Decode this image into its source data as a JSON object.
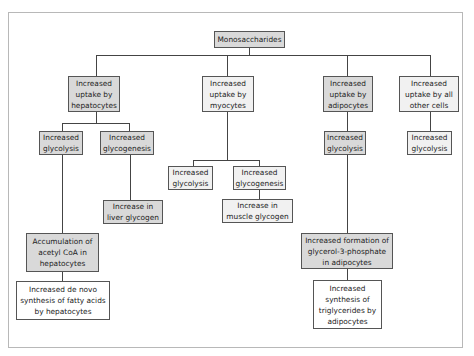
{
  "diagram": {
    "root": {
      "label": "Monosaccharides"
    },
    "branches": [
      {
        "label": "Increased\nuptake by\nhepatocytes",
        "children": [
          {
            "label": "Increased\nglycolysis"
          },
          {
            "label": "Increased\nglycogenesis"
          }
        ]
      },
      {
        "label": "Increased\nuptake by\nmyocytes",
        "children": [
          {
            "label": "Increased\nglycolysis"
          },
          {
            "label": "Increased\nglycogenesis"
          }
        ]
      },
      {
        "label": "Increased\nuptake by\nadipocytes",
        "children": [
          {
            "label": "Increased\nglycolysis"
          }
        ]
      },
      {
        "label": "Increased\nuptake by all\nother cells",
        "children": [
          {
            "label": "Increased\nglycolysis"
          }
        ]
      }
    ],
    "outcomes": {
      "liver_glycogen": "Increase in\nliver glycogen",
      "muscle_glycogen": "Increase in\nmuscle glycogen",
      "acetyl_coa": "Accumulation of\nacetyl CoA in\nhepatocytes",
      "de_novo": "Increased de novo\nsynthesis of fatty acids\nby hepatocytes",
      "glycerol": "Increased formation  of\nglycerol-3-phosphate\nin adipocytes",
      "triglycerides": "Increased\nsynthesis of\ntriglycerides by\nadipocytes"
    }
  },
  "colors": {
    "box_gray": "#d9d9d9",
    "box_light": "#f1f1f1",
    "border": "#555555",
    "line": "#444444",
    "frame": "#b8b8b8"
  }
}
